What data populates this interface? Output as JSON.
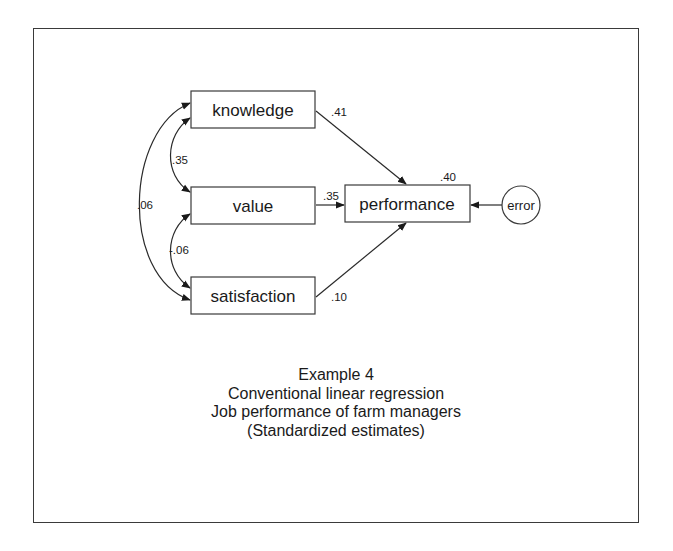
{
  "diagram": {
    "type": "path-diagram",
    "nodes": {
      "knowledge": {
        "label": "knowledge",
        "shape": "rect"
      },
      "value": {
        "label": "value",
        "shape": "rect"
      },
      "satisfaction": {
        "label": "satisfaction",
        "shape": "rect"
      },
      "performance": {
        "label": "performance",
        "shape": "rect",
        "r_squared": ".40"
      },
      "error": {
        "label": "error",
        "shape": "circle"
      }
    },
    "paths": {
      "knowledge_performance": ".41",
      "value_performance": ".35",
      "satisfaction_performance": ".10"
    },
    "covariances": {
      "knowledge_value": ".35",
      "value_satisfaction": "-.06",
      "knowledge_satisfaction": ".06"
    },
    "edges": [
      {
        "from": "knowledge",
        "to": "performance",
        "kind": "directed",
        "label": ".41"
      },
      {
        "from": "value",
        "to": "performance",
        "kind": "directed",
        "label": ".35"
      },
      {
        "from": "satisfaction",
        "to": "performance",
        "kind": "directed",
        "label": ".10"
      },
      {
        "from": "error",
        "to": "performance",
        "kind": "directed",
        "label": ""
      },
      {
        "from": "knowledge",
        "to": "value",
        "kind": "bidirected",
        "label": ".35"
      },
      {
        "from": "value",
        "to": "satisfaction",
        "kind": "bidirected",
        "label": "-.06"
      },
      {
        "from": "knowledge",
        "to": "satisfaction",
        "kind": "bidirected",
        "label": ".06"
      }
    ]
  },
  "caption": {
    "line1": "Example 4",
    "line2": "Conventional linear regression",
    "line3": "Job performance of farm managers",
    "line4": "(Standardized estimates)"
  }
}
